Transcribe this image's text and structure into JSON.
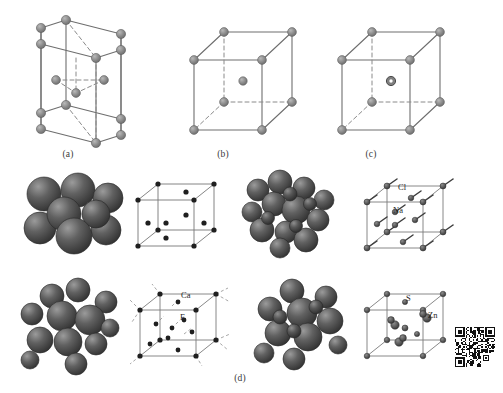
{
  "figure": {
    "background": "#ffffff",
    "header_faint_text": "",
    "panels": [
      {
        "id": "a",
        "caption": "(a)",
        "structure_name": "hexagonal-close-packed",
        "cell_type": "hexagonal prism",
        "atom_color": "#8c8c8c",
        "atom_count_visible": 15
      },
      {
        "id": "b",
        "caption": "(b)",
        "structure_name": "body-centered-cubic",
        "cell_type": "cube",
        "atom_color": "#8c8c8c",
        "center_atom": "filled"
      },
      {
        "id": "c",
        "caption": "(c)",
        "structure_name": "cesium-chloride-type",
        "cell_type": "cube",
        "atom_color": "#8c8c8c",
        "center_atom": "hollow"
      },
      {
        "id": "d",
        "caption": "(d)",
        "structure_name": "ionic-crystal-structures"
      }
    ],
    "compounds": [
      {
        "name": "sodium-chloride",
        "model": "space-filling",
        "cell_labels": [
          "Cl",
          "Na"
        ],
        "label_cation": "Na",
        "label_anion": "Cl"
      },
      {
        "name": "calcium-fluoride",
        "model": "space-filling",
        "cell_labels": [
          "Ca",
          "F"
        ],
        "label_cation": "Ca",
        "label_anion": "F"
      },
      {
        "name": "zinc-sulfide",
        "model": "space-filling",
        "cell_labels": [
          "S",
          "Zn"
        ],
        "label_cation": "Zn",
        "label_anion": "S"
      }
    ],
    "labels": {
      "cl": "Cl",
      "na": "Na",
      "ca": "Ca",
      "f": "F",
      "s": "S",
      "zn": "Zn"
    },
    "captions": {
      "a": "(a)",
      "b": "(b)",
      "c": "(c)",
      "d": "(d)"
    },
    "colors": {
      "line_solid": "#6e6e6e",
      "line_dashed": "#8a8a8a",
      "atom_gray": "#8c8c8c",
      "atom_dark": "#2b2b2b",
      "sphere_dark": "#4a4a4a",
      "sphere_light": "#9a9a9a",
      "text": "#1f1f1f"
    },
    "qr_code": {
      "present": true,
      "position": "bottom-right"
    }
  }
}
